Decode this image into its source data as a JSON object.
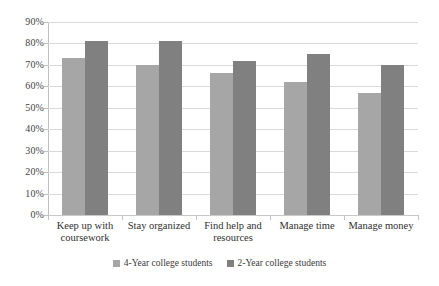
{
  "chart_data": {
    "type": "bar",
    "title": "",
    "subtitle": "",
    "xlabel": "",
    "ylabel": "",
    "ylim": [
      0,
      90
    ],
    "y_tick_labels": [
      "90%",
      "80%",
      "70%",
      "60%",
      "50%",
      "40%",
      "30%",
      "20%",
      "10%",
      "0%"
    ],
    "y_tick_values": [
      90,
      80,
      70,
      60,
      50,
      40,
      30,
      20,
      10,
      0
    ],
    "grid": "horizontal",
    "legend_position": "bottom",
    "categories": [
      "Keep up with coursework",
      "Stay organized",
      "Find help and resources",
      "Manage time",
      "Manage money"
    ],
    "series": [
      {
        "name": "4-Year college students",
        "color": "#a6a6a6",
        "values": [
          73,
          70,
          66,
          62,
          57
        ]
      },
      {
        "name": "2-Year college students",
        "color": "#808080",
        "values": [
          81,
          81,
          72,
          75,
          70
        ]
      }
    ]
  }
}
